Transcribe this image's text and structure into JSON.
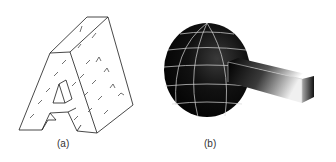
{
  "figure": {
    "panels": [
      {
        "id": "a",
        "label": "(a)",
        "description": "wireframe 3D letter A with vector field marks"
      },
      {
        "id": "b",
        "label": "(b)",
        "description": "shaded faceted sphere with protruding rectangular bar"
      }
    ],
    "colors": {
      "background": "#ffffff",
      "wireframe": "#1a1a1a",
      "sphere_fill": "#0a0a0a",
      "sphere_grid": "#d8d8d8",
      "caption": "#333333"
    }
  }
}
